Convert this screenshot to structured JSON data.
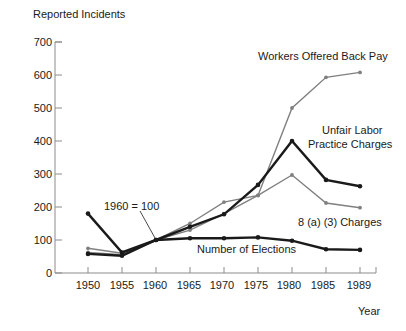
{
  "chart_data": {
    "type": "line",
    "title": "",
    "ylabel": "Reported Incidents",
    "xlabel": "Year",
    "grid": false,
    "legend_position": "inline-annotations",
    "categories": [
      "1950",
      "1955",
      "1960",
      "1965",
      "1970",
      "1975",
      "1980",
      "1985",
      "1989"
    ],
    "x": [
      1950,
      1955,
      1960,
      1965,
      1970,
      1975,
      1980,
      1985,
      1989
    ],
    "ylim": [
      0,
      700
    ],
    "yticks": [
      0,
      100,
      200,
      300,
      400,
      500,
      600,
      700
    ],
    "xlim": [
      1948,
      1991
    ],
    "note": "1960 = 100",
    "series": [
      {
        "name": "Workers Offered Back Pay",
        "color": "#808080",
        "values": [
          75,
          60,
          100,
          150,
          215,
          235,
          500,
          593,
          608
        ]
      },
      {
        "name": "Unfair Labor Practice Charges",
        "color": "#1a1a1a",
        "values": [
          180,
          62,
          100,
          140,
          178,
          267,
          400,
          282,
          263
        ]
      },
      {
        "name": "8 (a) (3) Charges",
        "color": "#808080",
        "values": [
          62,
          55,
          100,
          130,
          180,
          235,
          297,
          212,
          198
        ]
      },
      {
        "name": "Number of Elections",
        "color": "#1a1a1a",
        "values": [
          58,
          52,
          100,
          105,
          105,
          108,
          98,
          72,
          70
        ]
      }
    ],
    "annotations": [
      {
        "id": "workers-offered-back-pay-label",
        "text": "Workers Offered Back Pay",
        "x": 258,
        "y": 50
      },
      {
        "id": "unfair-labor-line1",
        "text": "Unfair Labor",
        "x": 322,
        "y": 124
      },
      {
        "id": "unfair-labor-line2",
        "text": "Practice Charges",
        "x": 308,
        "y": 138
      },
      {
        "id": "charges-8a3-label",
        "text": "8 (a) (3) Charges",
        "x": 298,
        "y": 216
      },
      {
        "id": "number-of-elections-label",
        "text": "Number of Elections",
        "x": 197,
        "y": 243
      },
      {
        "id": "baseline-note",
        "text": "1960 = 100",
        "x": 104,
        "y": 200
      }
    ]
  },
  "axis": {
    "y_title": "Reported Incidents",
    "x_title": "Year",
    "y_ticks": [
      "700",
      "600",
      "500",
      "400",
      "300",
      "200",
      "100",
      "0"
    ],
    "x_ticks": [
      "1950",
      "1955",
      "1960",
      "1965",
      "1970",
      "1975",
      "1980",
      "1985",
      "1989"
    ]
  },
  "colors": {
    "axis": "#8c8c8c",
    "dark_series": "#1a1a1a",
    "gray_series": "#808080",
    "text": "#1a1a1a",
    "background": "#ffffff"
  }
}
